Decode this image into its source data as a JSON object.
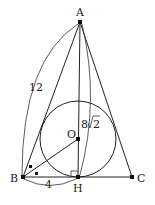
{
  "diagram": {
    "points": {
      "A": {
        "label": "A",
        "x": 80,
        "y": 22
      },
      "B": {
        "label": "B",
        "x": 23,
        "y": 177
      },
      "C": {
        "label": "C",
        "x": 132,
        "y": 177
      },
      "H": {
        "label": "H",
        "x": 78,
        "y": 177
      },
      "O": {
        "label": "O",
        "x": 78,
        "y": 139
      }
    },
    "segments": [
      {
        "from": "A",
        "to": "B"
      },
      {
        "from": "A",
        "to": "C"
      },
      {
        "from": "B",
        "to": "C"
      },
      {
        "from": "A",
        "to": "H"
      },
      {
        "from": "B",
        "to": "O"
      }
    ],
    "circle": {
      "name": "incircle",
      "cx": 78,
      "cy": 139,
      "r": 38
    },
    "measurements": {
      "AB": "12",
      "AH": "8√2",
      "AH_radical_coefficient": "8",
      "AH_radicand": "2",
      "BH": "4"
    },
    "marks": {
      "right_angle_at": "H",
      "equal_angles_at": "B"
    }
  }
}
